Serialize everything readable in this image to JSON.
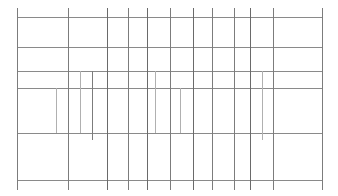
{
  "document": {
    "type": "table-skeleton",
    "title": "",
    "description": "Empty table grid: horizontal row rules and vertical column rules, no text content",
    "canvas": {
      "width": 338,
      "height": 196,
      "background": "#ffffff"
    },
    "colors": {
      "rule_primary": "#8a8a8a",
      "rule_secondary": "#7c7c7c",
      "rule_strong": "#6a6a6a",
      "rule_faint": "#b4b4b4",
      "background": "#ffffff"
    },
    "bounds": {
      "left": 17,
      "right": 322,
      "top": 17,
      "bottom": 180
    },
    "row_rules": [
      {
        "name": "header-top-rule",
        "y": 17,
        "x1": 17,
        "x2": 322,
        "weight": "primary"
      },
      {
        "name": "header-bottom-rule",
        "y": 47,
        "x1": 17,
        "x2": 322,
        "weight": "primary"
      },
      {
        "name": "body-rule-1",
        "y": 71,
        "x1": 17,
        "x2": 322,
        "weight": "primary"
      },
      {
        "name": "body-rule-2",
        "y": 88,
        "x1": 17,
        "x2": 322,
        "weight": "primary"
      },
      {
        "name": "body-rule-3",
        "y": 133,
        "x1": 17,
        "x2": 322,
        "weight": "primary"
      },
      {
        "name": "footer-rule",
        "y": 180,
        "x1": 17,
        "x2": 322,
        "weight": "primary"
      }
    ],
    "column_rules": [
      {
        "name": "left-border",
        "x": 17,
        "y1": 8,
        "y2": 190,
        "weight": "secondary"
      },
      {
        "name": "column-sep-1",
        "x": 56,
        "y1": 88,
        "y2": 133,
        "weight": "faint"
      },
      {
        "name": "column-sep-2",
        "x": 68,
        "y1": 8,
        "y2": 190,
        "weight": "secondary"
      },
      {
        "name": "column-sep-3",
        "x": 80,
        "y1": 71,
        "y2": 133,
        "weight": "faint"
      },
      {
        "name": "column-sep-4",
        "x": 92,
        "y1": 71,
        "y2": 140,
        "weight": "secondary"
      },
      {
        "name": "column-sep-5",
        "x": 107,
        "y1": 8,
        "y2": 190,
        "weight": "strong"
      },
      {
        "name": "column-sep-6",
        "x": 128,
        "y1": 8,
        "y2": 190,
        "weight": "secondary"
      },
      {
        "name": "column-sep-7",
        "x": 147,
        "y1": 8,
        "y2": 190,
        "weight": "strong"
      },
      {
        "name": "column-sep-8",
        "x": 155,
        "y1": 71,
        "y2": 133,
        "weight": "faint"
      },
      {
        "name": "column-sep-9",
        "x": 170,
        "y1": 8,
        "y2": 190,
        "weight": "secondary"
      },
      {
        "name": "column-sep-10",
        "x": 180,
        "y1": 88,
        "y2": 133,
        "weight": "faint"
      },
      {
        "name": "column-sep-11",
        "x": 193,
        "y1": 8,
        "y2": 190,
        "weight": "strong"
      },
      {
        "name": "column-sep-12",
        "x": 212,
        "y1": 8,
        "y2": 190,
        "weight": "secondary"
      },
      {
        "name": "column-sep-13",
        "x": 234,
        "y1": 8,
        "y2": 190,
        "weight": "secondary"
      },
      {
        "name": "column-sep-14",
        "x": 250,
        "y1": 8,
        "y2": 190,
        "weight": "strong"
      },
      {
        "name": "column-sep-15",
        "x": 262,
        "y1": 71,
        "y2": 140,
        "weight": "faint"
      },
      {
        "name": "column-sep-16",
        "x": 273,
        "y1": 8,
        "y2": 190,
        "weight": "secondary"
      },
      {
        "name": "right-border",
        "x": 322,
        "y1": 8,
        "y2": 190,
        "weight": "secondary"
      }
    ]
  }
}
